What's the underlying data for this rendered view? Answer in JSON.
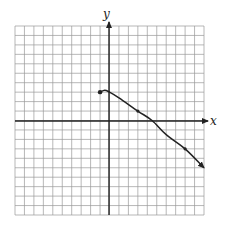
{
  "chart_data": {
    "type": "line",
    "title": "",
    "xlabel": "x",
    "ylabel": "y",
    "xlim": [
      -10,
      10
    ],
    "ylim": [
      -10,
      10
    ],
    "grid": true,
    "tick_labels": false,
    "series": [
      {
        "name": "f(x)",
        "start_point": {
          "x": -1,
          "y": 3,
          "marker": "closed-dot"
        },
        "points": [
          {
            "x": -1,
            "y": 3
          },
          {
            "x": -0.5,
            "y": 3.2
          },
          {
            "x": 0,
            "y": 3
          },
          {
            "x": 1,
            "y": 2.4
          },
          {
            "x": 3,
            "y": 1
          },
          {
            "x": 4.5,
            "y": 0
          },
          {
            "x": 6,
            "y": -1.5
          },
          {
            "x": 8,
            "y": -3
          },
          {
            "x": 10,
            "y": -5
          }
        ],
        "marked_points": [
          {
            "x": 3,
            "y": 1
          },
          {
            "x": 8,
            "y": -3
          }
        ],
        "end": "arrow"
      }
    ]
  },
  "labels": {
    "x_axis": "x",
    "y_axis": "y"
  }
}
